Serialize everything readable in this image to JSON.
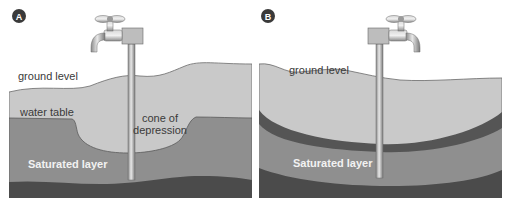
{
  "panels": [
    {
      "id": "A",
      "badge": "A",
      "labels": {
        "ground_level": "ground level",
        "water_table": "water table",
        "cone_line1": "cone of",
        "cone_line2": "depression",
        "saturated": "Saturated layer"
      }
    },
    {
      "id": "B",
      "badge": "B",
      "labels": {
        "ground_level": "ground level",
        "saturated": "Saturated layer"
      }
    }
  ],
  "colors": {
    "soil_light": "#c8c8c8",
    "saturated": "#8e8e8e",
    "bedrock": "#4a4a4a",
    "clay_band": "#555555",
    "pipe": "#b8b8b8",
    "badge": "#3a3a3a"
  }
}
